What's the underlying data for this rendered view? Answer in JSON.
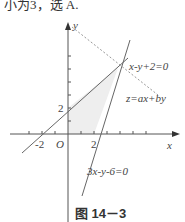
{
  "top_text": "小为3，选 A.",
  "axes": {
    "x_label": "x",
    "y_label": "y",
    "origin_label": "O"
  },
  "ticks": {
    "neg2": "-2",
    "pos2_x": "2",
    "pos2_y": "2"
  },
  "lines": {
    "line1": "x-y+2=0",
    "line2": "3x-y-6=0",
    "objective": "z=ax+by"
  },
  "caption": "图 14－3",
  "colors": {
    "line": "#666666",
    "shade": "#eeeeee",
    "dashed": "#999999"
  }
}
